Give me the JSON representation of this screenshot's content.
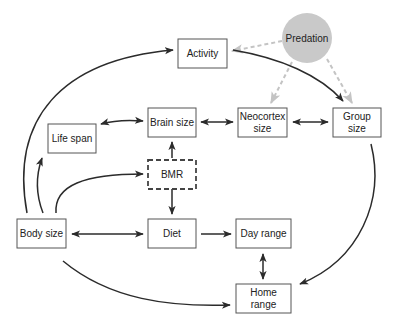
{
  "diagram": {
    "title": "",
    "nodes": {
      "activity": {
        "label": "Activity"
      },
      "predation": {
        "label": "Predation"
      },
      "life_span": {
        "label": "Life span"
      },
      "brain_size": {
        "label": "Brain size"
      },
      "neocortex": {
        "line1": "Neocortex",
        "line2": "size"
      },
      "group_size": {
        "line1": "Group",
        "line2": "size"
      },
      "bmr": {
        "label": "BMR"
      },
      "body_size": {
        "label": "Body size"
      },
      "diet": {
        "label": "Diet"
      },
      "day_range": {
        "label": "Day range"
      },
      "home_range": {
        "line1": "Home",
        "line2": "range"
      }
    },
    "edges": [
      {
        "from": "Body size",
        "to": "Activity",
        "type": "one-way"
      },
      {
        "from": "Body size",
        "to": "Life span",
        "type": "one-way"
      },
      {
        "from": "Body size",
        "to": "BMR",
        "type": "one-way"
      },
      {
        "from": "Body size",
        "to": "Diet",
        "type": "two-way"
      },
      {
        "from": "Body size",
        "to": "Home range",
        "type": "one-way"
      },
      {
        "from": "Life span",
        "to": "Brain size",
        "type": "two-way"
      },
      {
        "from": "Brain size",
        "to": "Neocortex size",
        "type": "two-way"
      },
      {
        "from": "Neocortex size",
        "to": "Group size",
        "type": "two-way"
      },
      {
        "from": "BMR",
        "to": "Brain size",
        "type": "one-way"
      },
      {
        "from": "BMR",
        "to": "Diet",
        "type": "one-way"
      },
      {
        "from": "Diet",
        "to": "Day range",
        "type": "one-way"
      },
      {
        "from": "Day range",
        "to": "Home range",
        "type": "two-way"
      },
      {
        "from": "Activity",
        "to": "Group size",
        "type": "one-way"
      },
      {
        "from": "Group size",
        "to": "Home range",
        "type": "one-way"
      },
      {
        "from": "Predation",
        "to": "Activity",
        "type": "dashed"
      },
      {
        "from": "Predation",
        "to": "Neocortex size",
        "type": "dashed"
      },
      {
        "from": "Predation",
        "to": "Group size",
        "type": "dashed"
      }
    ],
    "colors": {
      "edge": "#2b2b2b",
      "predation_fill": "#c9c9c9",
      "predation_edge": "#c4c4c4",
      "box_border": "#555555"
    }
  }
}
